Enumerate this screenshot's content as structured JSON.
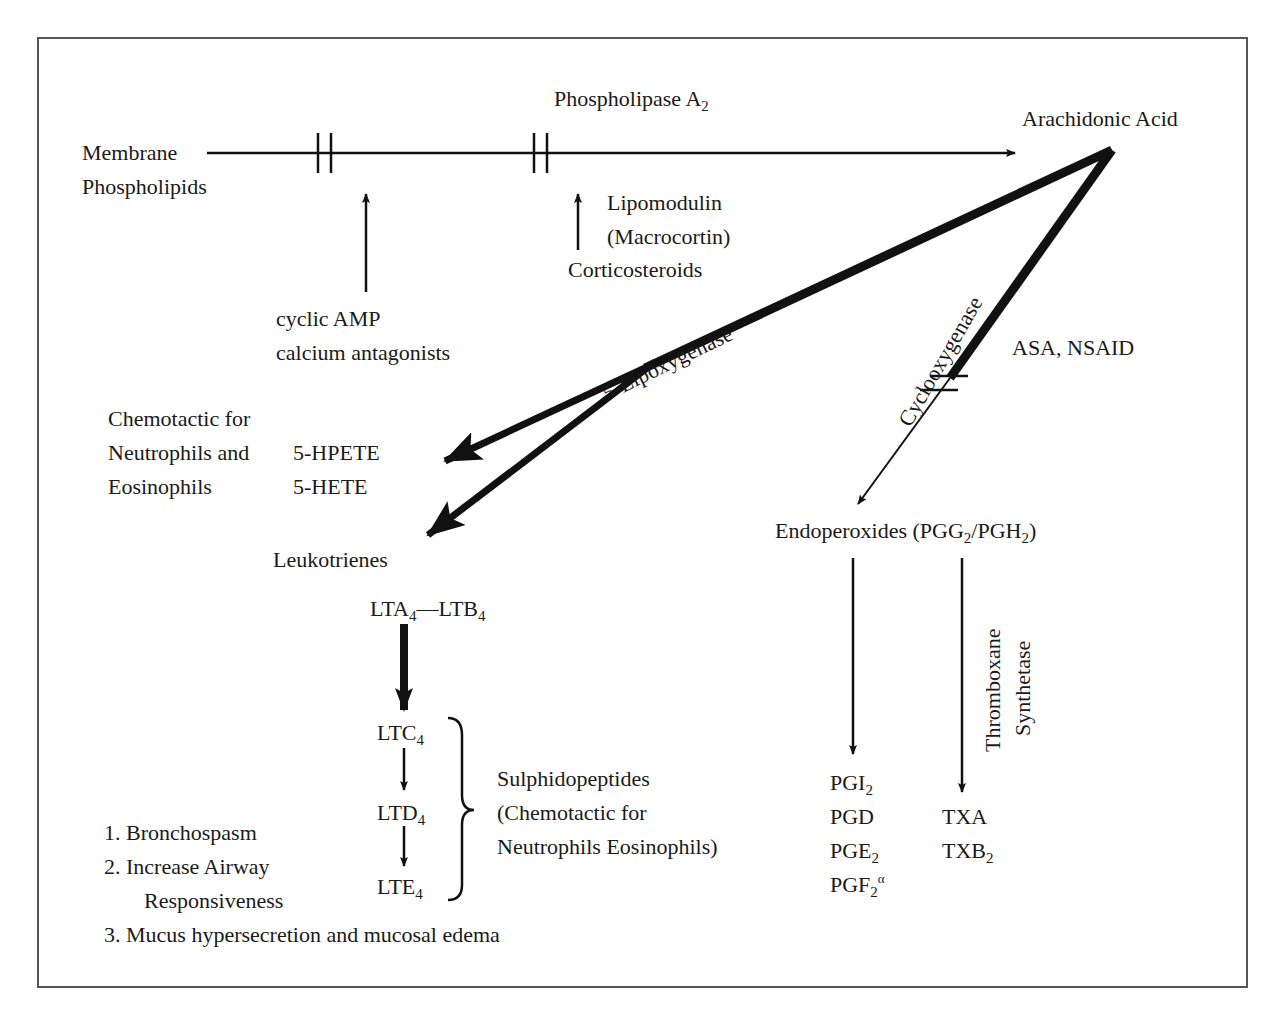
{
  "diagram": {
    "nodes": {
      "membrane": [
        "Membrane",
        "Phospholipids"
      ],
      "phospholipase": "Phospholipase A",
      "phospholipase_sub": "2",
      "arachidonic": "Arachidonic Acid",
      "camp": [
        "cyclic AMP",
        "calcium antagonists"
      ],
      "lipomodulin": [
        "Lipomodulin",
        "(Macrocortin)"
      ],
      "corticosteroids": "Corticosteroids",
      "lipoxygenase": "5-Lipoxygenase",
      "cyclooxygenase": "Cyclooxygenase",
      "asa": "ASA, NSAID",
      "chemotactic": [
        "Chemotactic for",
        "Neutrophils and",
        "Eosinophils"
      ],
      "hpete": "5-HPETE",
      "hete": "5-HETE",
      "leukotrienes": "Leukotrienes",
      "lta": "LTA",
      "ltb": "—LTB",
      "ltc": "LTC",
      "ltd": "LTD",
      "lte": "LTE",
      "lt_sub": "4",
      "sulphido": [
        "Sulphidopeptides",
        "(Chemotactic for",
        "Neutrophils Eosinophils)"
      ],
      "effects": [
        "1. Bronchospasm",
        "2. Increase Airway",
        "Responsiveness",
        "3. Mucus hypersecretion and mucosal edema"
      ],
      "endoperoxides_a": "Endoperoxides (PGG",
      "endoperoxides_b": "/PGH",
      "endoperoxides_c": ")",
      "pg_sub": "2",
      "thromboxane": [
        "Thromboxane",
        "Synthetase"
      ],
      "pgi": "PGI",
      "pgd": "PGD",
      "pge": "PGE",
      "pgf": "PGF",
      "pgf_sup": "α",
      "txa": "TXA",
      "txb": "TXB"
    },
    "colors": {
      "line": "#111111",
      "frame": "#555555",
      "text": "#1a1a1a"
    }
  }
}
